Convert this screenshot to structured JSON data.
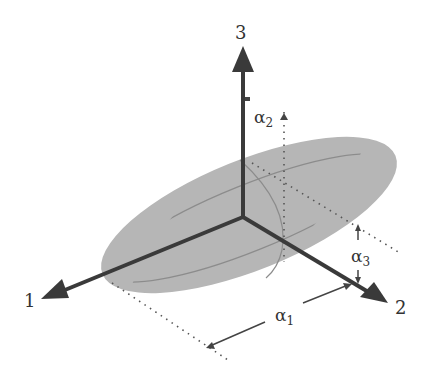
{
  "diagram": {
    "type": "ellipsoid-axes",
    "axes": [
      {
        "id": "axis-1",
        "label": "1"
      },
      {
        "id": "axis-2",
        "label": "2"
      },
      {
        "id": "axis-3",
        "label": "3"
      }
    ],
    "dimensions": [
      {
        "id": "alpha-1",
        "symbol": "α",
        "subscript": "1"
      },
      {
        "id": "alpha-2",
        "symbol": "α",
        "subscript": "2"
      },
      {
        "id": "alpha-3",
        "symbol": "α",
        "subscript": "3"
      }
    ],
    "colors": {
      "ellipsoid_fill": "#b4b4b4",
      "ellipsoid_edge": "#8a8a8a",
      "axis": "#3a3a3a",
      "text": "#333333"
    }
  }
}
